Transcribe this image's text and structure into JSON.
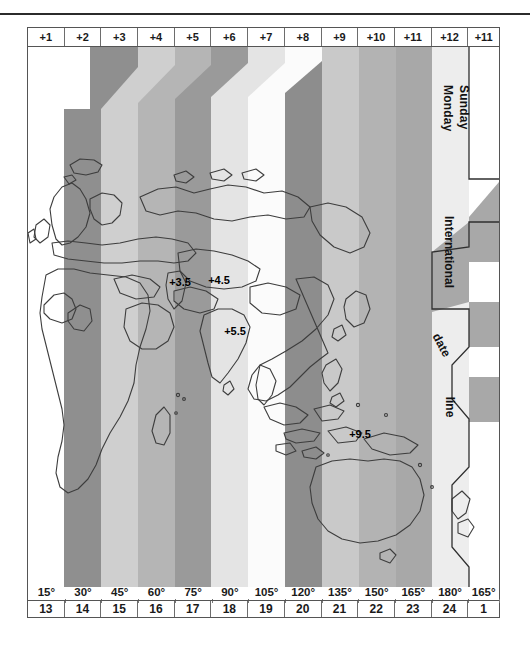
{
  "header": {
    "offsets": [
      "+1",
      "+2",
      "+3",
      "+4",
      "+5",
      "+6",
      "+7",
      "+8",
      "+9",
      "+10",
      "+11",
      "+12",
      "+11"
    ]
  },
  "footer": {
    "degrees": [
      "15°",
      "30°",
      "45°",
      "60°",
      "75°",
      "90°",
      "105°",
      "120°",
      "135°",
      "150°",
      "165°",
      "180°",
      "165°"
    ],
    "hours": [
      "13",
      "14",
      "15",
      "16",
      "17",
      "18",
      "19",
      "20",
      "21",
      "22",
      "23",
      "24",
      "1"
    ]
  },
  "map": {
    "zone_labels": [
      {
        "text": "+3.5",
        "x": 152,
        "y": 239
      },
      {
        "text": "+4.5",
        "x": 191,
        "y": 237
      },
      {
        "text": "+5.5",
        "x": 207,
        "y": 288
      },
      {
        "text": "+9.5",
        "x": 332,
        "y": 391
      }
    ],
    "day_labels": [
      {
        "text": "Monday"
      },
      {
        "text": "Sunday"
      }
    ],
    "date_line_label": {
      "word1": "International",
      "word2": "date",
      "word3": "line"
    },
    "colors": {
      "band_white": "#ffffff",
      "band_pale": "#f0f0f0",
      "band_light": "#d0d0d0",
      "band_medium": "#b6b6b6",
      "band_dark": "#9a9a9a",
      "band_darker": "#8d8d8d",
      "coastline": "#3a3a3a",
      "frame": "#555555",
      "text": "#1a1a1a"
    }
  },
  "chart_data": {
    "type": "map",
    "xlabel": "East longitude / local hour",
    "axis_top": [
      "+1",
      "+2",
      "+3",
      "+4",
      "+5",
      "+6",
      "+7",
      "+8",
      "+9",
      "+10",
      "+11",
      "+12",
      "+11"
    ],
    "axis_bottom_degrees": [
      "15°",
      "30°",
      "45°",
      "60°",
      "75°",
      "90°",
      "105°",
      "120°",
      "135°",
      "150°",
      "165°",
      "180°",
      "165°"
    ],
    "axis_bottom_hours": [
      "13",
      "14",
      "15",
      "16",
      "17",
      "18",
      "19",
      "20",
      "21",
      "22",
      "23",
      "24",
      "1"
    ],
    "annotations": [
      "+3.5",
      "+4.5",
      "+5.5",
      "+9.5",
      "Sunday",
      "Monday",
      "International date line"
    ],
    "zone_count": 13,
    "half_hour_zones": [
      {
        "label": "+3.5",
        "region": "Iran"
      },
      {
        "label": "+4.5",
        "region": "Afghanistan"
      },
      {
        "label": "+5.5",
        "region": "India"
      },
      {
        "label": "+9.5",
        "region": "Central Australia"
      }
    ]
  }
}
